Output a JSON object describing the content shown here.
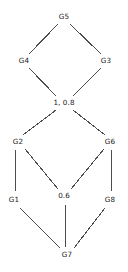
{
  "figure": {
    "type": "node-link-diagram",
    "width": 128,
    "height": 272,
    "background_color": "#ffffff",
    "edge_color": "#4d4d4d",
    "label_color": "#1a1a1a"
  },
  "graph_data": {
    "type": "diagram",
    "layout": "two-stacked-diamonds",
    "nodes": [
      {
        "id": "G5",
        "label": "G5",
        "x": 64,
        "y": 17
      },
      {
        "id": "G4",
        "label": "G4",
        "x": 24,
        "y": 61
      },
      {
        "id": "G3",
        "label": "G3",
        "x": 106,
        "y": 61
      },
      {
        "id": "M1",
        "label": "1, 0.8",
        "x": 64,
        "y": 103
      },
      {
        "id": "G2",
        "label": "G2",
        "x": 18,
        "y": 142
      },
      {
        "id": "G6",
        "label": "G6",
        "x": 110,
        "y": 142
      },
      {
        "id": "G1",
        "label": "G1",
        "x": 14,
        "y": 200
      },
      {
        "id": "M06",
        "label": "0.6",
        "x": 64,
        "y": 196
      },
      {
        "id": "G8",
        "label": "G8",
        "x": 110,
        "y": 200
      },
      {
        "id": "G7",
        "label": "G7",
        "x": 67,
        "y": 255
      }
    ],
    "edges": [
      {
        "from": "G5",
        "to": "G4",
        "x1": 58,
        "y1": 24,
        "x2": 29,
        "y2": 54
      },
      {
        "from": "G5",
        "to": "G3",
        "x1": 70,
        "y1": 24,
        "x2": 101,
        "y2": 54
      },
      {
        "from": "G4",
        "to": "M1",
        "x1": 29,
        "y1": 68,
        "x2": 56,
        "y2": 96
      },
      {
        "from": "G3",
        "to": "M1",
        "x1": 101,
        "y1": 68,
        "x2": 73,
        "y2": 96
      },
      {
        "from": "M1",
        "to": "G2",
        "x1": 56,
        "y1": 110,
        "x2": 23,
        "y2": 135
      },
      {
        "from": "M1",
        "to": "G6",
        "x1": 73,
        "y1": 110,
        "x2": 105,
        "y2": 135
      },
      {
        "from": "G2",
        "to": "G1",
        "x1": 16,
        "y1": 150,
        "x2": 15,
        "y2": 192
      },
      {
        "from": "G2",
        "to": "M06",
        "x1": 25,
        "y1": 149,
        "x2": 58,
        "y2": 189
      },
      {
        "from": "G6",
        "to": "M06",
        "x1": 104,
        "y1": 149,
        "x2": 71,
        "y2": 189
      },
      {
        "from": "G6",
        "to": "G8",
        "x1": 112,
        "y1": 150,
        "x2": 111,
        "y2": 192
      },
      {
        "from": "G1",
        "to": "G7",
        "x1": 20,
        "y1": 208,
        "x2": 60,
        "y2": 248
      },
      {
        "from": "M06",
        "to": "G7",
        "x1": 65,
        "y1": 204,
        "x2": 66,
        "y2": 247
      },
      {
        "from": "G8",
        "to": "G7",
        "x1": 105,
        "y1": 208,
        "x2": 74,
        "y2": 248
      }
    ]
  }
}
